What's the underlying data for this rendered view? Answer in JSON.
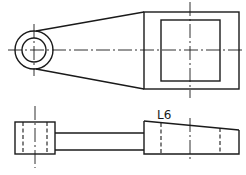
{
  "drawing": {
    "type": "orthographic technical drawing",
    "views": [
      "top-view",
      "front-view"
    ],
    "annotation": {
      "label": "L6"
    },
    "colors": {
      "line": "#1a1a1a",
      "background": "#ffffff"
    }
  }
}
